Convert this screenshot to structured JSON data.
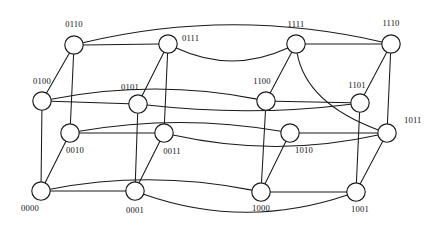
{
  "figure": {
    "node_radius": 9.2,
    "stroke_color": "#1a1a1a",
    "node_fill": "#ffffff",
    "background": "#ffffff",
    "width": 441,
    "height": 237
  },
  "nodes": [
    {
      "id": "0110",
      "label": "0110",
      "x": 74,
      "y": 45,
      "label_x": 74,
      "label_y": 27,
      "anchor": "middle"
    },
    {
      "id": "0111",
      "label": "0111",
      "x": 168,
      "y": 44,
      "label_x": 182,
      "label_y": 41,
      "anchor": "start"
    },
    {
      "id": "1111",
      "label": "1111",
      "x": 296,
      "y": 44,
      "label_x": 296,
      "label_y": 27,
      "anchor": "middle"
    },
    {
      "id": "1110",
      "label": "1110",
      "x": 391,
      "y": 44,
      "label_x": 391,
      "label_y": 26,
      "anchor": "middle"
    },
    {
      "id": "0100",
      "label": "0100",
      "x": 42,
      "y": 101,
      "label_x": 42,
      "label_y": 84,
      "anchor": "middle"
    },
    {
      "id": "0101",
      "label": "0101",
      "x": 138,
      "y": 104,
      "label_x": 130,
      "label_y": 90,
      "anchor": "middle"
    },
    {
      "id": "1100",
      "label": "1100",
      "x": 266,
      "y": 101,
      "label_x": 262,
      "label_y": 84,
      "anchor": "middle"
    },
    {
      "id": "1101",
      "label": "1101",
      "x": 360,
      "y": 103,
      "label_x": 357,
      "label_y": 88,
      "anchor": "middle"
    },
    {
      "id": "1011",
      "label": "1011",
      "x": 387,
      "y": 133,
      "label_x": 404,
      "label_y": 123,
      "anchor": "start"
    },
    {
      "id": "0010",
      "label": "0010",
      "x": 70,
      "y": 133,
      "label_x": 75,
      "label_y": 153,
      "anchor": "middle"
    },
    {
      "id": "0011",
      "label": "0011",
      "x": 164,
      "y": 133,
      "label_x": 172,
      "label_y": 154,
      "anchor": "middle"
    },
    {
      "id": "1010",
      "label": "1010",
      "x": 290,
      "y": 133,
      "label_x": 304,
      "label_y": 153,
      "anchor": "middle"
    },
    {
      "id": "0000",
      "label": "0000",
      "x": 41,
      "y": 191,
      "label_x": 30,
      "label_y": 211,
      "anchor": "middle"
    },
    {
      "id": "0001",
      "label": "0001",
      "x": 135,
      "y": 191,
      "label_x": 135,
      "label_y": 213,
      "anchor": "middle"
    },
    {
      "id": "1000",
      "label": "1000",
      "x": 261,
      "y": 192,
      "label_x": 261,
      "label_y": 211,
      "anchor": "middle"
    },
    {
      "id": "1001",
      "label": "1001",
      "x": 356,
      "y": 192,
      "label_x": 360,
      "label_y": 212,
      "anchor": "middle"
    }
  ],
  "edges": [
    {
      "from": "0110",
      "to": "0111",
      "kind": "straight"
    },
    {
      "from": "0110",
      "to": "0100",
      "kind": "straight"
    },
    {
      "from": "0110",
      "to": "0010",
      "kind": "straight"
    },
    {
      "from": "0110",
      "to": "1110",
      "kind": "curve",
      "cx": 230,
      "cy": 5
    },
    {
      "from": "0111",
      "to": "0101",
      "kind": "straight"
    },
    {
      "from": "0111",
      "to": "0011",
      "kind": "straight"
    },
    {
      "from": "0111",
      "to": "1111",
      "kind": "curve",
      "cx": 232,
      "cy": 78
    },
    {
      "from": "1111",
      "to": "1110",
      "kind": "straight"
    },
    {
      "from": "1111",
      "to": "1100",
      "kind": "straight"
    },
    {
      "from": "1111",
      "to": "1011",
      "kind": "curve",
      "cx": 300,
      "cy": 104
    },
    {
      "from": "1110",
      "to": "1101",
      "kind": "straight"
    },
    {
      "from": "1110",
      "to": "1011",
      "kind": "straight"
    },
    {
      "from": "0100",
      "to": "0101",
      "kind": "straight"
    },
    {
      "from": "0100",
      "to": "0000",
      "kind": "straight"
    },
    {
      "from": "0100",
      "to": "1100",
      "kind": "curve",
      "cx": 156,
      "cy": 77
    },
    {
      "from": "0101",
      "to": "0001",
      "kind": "straight"
    },
    {
      "from": "0101",
      "to": "1101",
      "kind": "curve",
      "cx": 250,
      "cy": 118
    },
    {
      "from": "1100",
      "to": "1101",
      "kind": "straight"
    },
    {
      "from": "1100",
      "to": "1000",
      "kind": "straight"
    },
    {
      "from": "1101",
      "to": "1001",
      "kind": "straight"
    },
    {
      "from": "1011",
      "to": "1010",
      "kind": "straight"
    },
    {
      "from": "1011",
      "to": "1001",
      "kind": "straight"
    },
    {
      "from": "0010",
      "to": "0011",
      "kind": "straight"
    },
    {
      "from": "0010",
      "to": "0000",
      "kind": "straight"
    },
    {
      "from": "0010",
      "to": "1010",
      "kind": "curve",
      "cx": 180,
      "cy": 112
    },
    {
      "from": "0011",
      "to": "0001",
      "kind": "straight"
    },
    {
      "from": "0011",
      "to": "1011",
      "kind": "curve",
      "cx": 276,
      "cy": 160
    },
    {
      "from": "1010",
      "to": "1000",
      "kind": "straight"
    },
    {
      "from": "0000",
      "to": "0001",
      "kind": "straight"
    },
    {
      "from": "0000",
      "to": "1000",
      "kind": "curve",
      "cx": 150,
      "cy": 168
    },
    {
      "from": "0001",
      "to": "1001",
      "kind": "curve",
      "cx": 245,
      "cy": 233
    },
    {
      "from": "1000",
      "to": "1001",
      "kind": "straight"
    }
  ]
}
